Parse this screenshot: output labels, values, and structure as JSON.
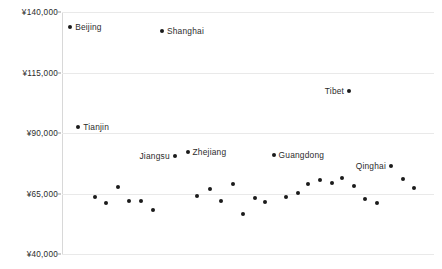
{
  "chart_data": {
    "type": "scatter",
    "title": "",
    "subtitle": "",
    "xlabel": "",
    "ylabel": "",
    "currency_symbol": "¥",
    "grid": true,
    "legend": "none",
    "xlim": [
      0,
      32
    ],
    "ylim": [
      40000,
      140000
    ],
    "y_ticks": [
      140000,
      115000,
      90000,
      65000,
      40000
    ],
    "y_tick_labels": [
      "¥140,000",
      "¥115,000",
      "¥90,000",
      "¥65,000",
      "¥40,000"
    ],
    "x_tick_labels": [],
    "marker_color": "#1b1b1b",
    "gridline_color": "#e9e9e9",
    "axis_color": "#d8d8d8",
    "points": [
      {
        "label": "Beijing",
        "x": 0.7,
        "y": 134000,
        "label_pos": "right"
      },
      {
        "label": "Tianjin",
        "x": 1.4,
        "y": 92500,
        "label_pos": "right"
      },
      {
        "label": "",
        "x": 2.8,
        "y": 63500,
        "label_pos": "none"
      },
      {
        "label": "",
        "x": 3.8,
        "y": 61200,
        "label_pos": "none"
      },
      {
        "label": "",
        "x": 4.8,
        "y": 67500,
        "label_pos": "none"
      },
      {
        "label": "",
        "x": 5.8,
        "y": 61800,
        "label_pos": "none"
      },
      {
        "label": "",
        "x": 6.8,
        "y": 62100,
        "label_pos": "none"
      },
      {
        "label": "",
        "x": 7.8,
        "y": 58200,
        "label_pos": "none"
      },
      {
        "label": "Shanghai",
        "x": 8.6,
        "y": 132000,
        "label_pos": "right"
      },
      {
        "label": "Jiangsu",
        "x": 9.7,
        "y": 80500,
        "label_pos": "left"
      },
      {
        "label": "Zhejiang",
        "x": 10.8,
        "y": 82000,
        "label_pos": "right"
      },
      {
        "label": "",
        "x": 11.6,
        "y": 64000,
        "label_pos": "none"
      },
      {
        "label": "",
        "x": 12.7,
        "y": 66800,
        "label_pos": "none"
      },
      {
        "label": "",
        "x": 13.7,
        "y": 61700,
        "label_pos": "none"
      },
      {
        "label": "",
        "x": 14.7,
        "y": 69000,
        "label_pos": "none"
      },
      {
        "label": "",
        "x": 15.6,
        "y": 56400,
        "label_pos": "none"
      },
      {
        "label": "",
        "x": 16.6,
        "y": 63200,
        "label_pos": "none"
      },
      {
        "label": "",
        "x": 17.5,
        "y": 61500,
        "label_pos": "none"
      },
      {
        "label": "Guangdong",
        "x": 18.2,
        "y": 81000,
        "label_pos": "right"
      },
      {
        "label": "",
        "x": 19.3,
        "y": 63700,
        "label_pos": "none"
      },
      {
        "label": "",
        "x": 20.3,
        "y": 65200,
        "label_pos": "none"
      },
      {
        "label": "",
        "x": 21.2,
        "y": 68800,
        "label_pos": "none"
      },
      {
        "label": "",
        "x": 22.2,
        "y": 70700,
        "label_pos": "none"
      },
      {
        "label": "",
        "x": 23.2,
        "y": 69200,
        "label_pos": "none"
      },
      {
        "label": "",
        "x": 24.1,
        "y": 71500,
        "label_pos": "none"
      },
      {
        "label": "",
        "x": 25.1,
        "y": 68200,
        "label_pos": "none"
      },
      {
        "label": "",
        "x": 26.1,
        "y": 62800,
        "label_pos": "none"
      },
      {
        "label": "",
        "x": 27.1,
        "y": 60900,
        "label_pos": "none"
      },
      {
        "label": "Qinghai",
        "x": 28.3,
        "y": 76500,
        "label_pos": "left"
      },
      {
        "label": "",
        "x": 29.3,
        "y": 71000,
        "label_pos": "none"
      },
      {
        "label": "",
        "x": 30.3,
        "y": 67300,
        "label_pos": "none"
      },
      {
        "label": "Tibet",
        "x": 24.7,
        "y": 107500,
        "label_pos": "left"
      }
    ]
  }
}
